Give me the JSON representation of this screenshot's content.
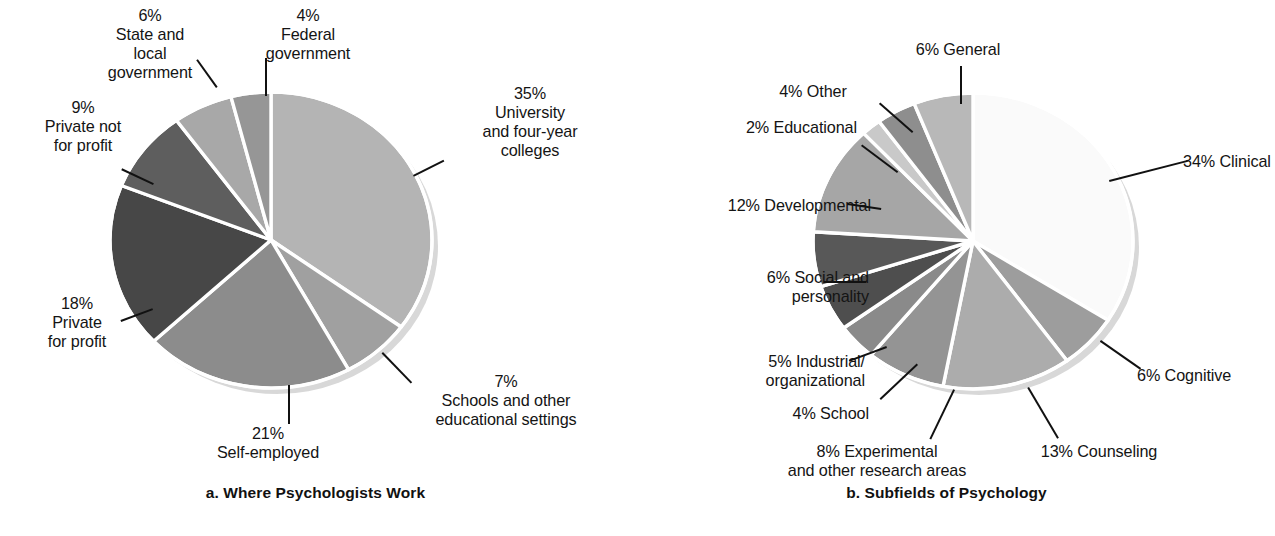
{
  "chart_data": [
    {
      "type": "pie",
      "id": "a",
      "title": "a. Where Psychologists Work",
      "caption": "a. Where Psychologists Work",
      "legend_position": "callout-labels",
      "start_angle_deg": 0,
      "total": 100,
      "unit": "%",
      "slices": [
        {
          "label": "University and four-year colleges",
          "label_lines": "35%\nUniversity\nand four-year\ncolleges",
          "percent_text": "35%",
          "value": 35,
          "color": "#b4b4b4"
        },
        {
          "label": "Schools and other educational settings",
          "label_lines": "7%\nSchools and other\neducational settings",
          "percent_text": "7%",
          "value": 7,
          "color": "#a0a0a0"
        },
        {
          "label": "Self-employed",
          "label_lines": "21%\nSelf-employed",
          "percent_text": "21%",
          "value": 21,
          "color": "#8c8c8c"
        },
        {
          "label": "Private for profit",
          "label_lines": "18%\nPrivate\nfor profit",
          "percent_text": "18%",
          "value": 18,
          "color": "#474747"
        },
        {
          "label": "Private not for profit",
          "label_lines": "9%\nPrivate not\nfor profit",
          "percent_text": "9%",
          "value": 9,
          "color": "#5e5e5e"
        },
        {
          "label": "State and local government",
          "label_lines": "6%\nState and\nlocal\ngovernment",
          "percent_text": "6%",
          "value": 6,
          "color": "#a8a8a8"
        },
        {
          "label": "Federal government",
          "label_lines": "4%\nFederal\ngovernment",
          "percent_text": "4%",
          "value": 4,
          "color": "#969696"
        }
      ]
    },
    {
      "type": "pie",
      "id": "b",
      "title": "b. Subfields of Psychology",
      "caption": "b. Subfields of Psychology",
      "legend_position": "callout-labels",
      "start_angle_deg": 0,
      "total": 100,
      "unit": "%",
      "slices": [
        {
          "label": "Clinical",
          "label_lines": "34% Clinical",
          "percent_text": "34%",
          "value": 34,
          "color": "#fafafa"
        },
        {
          "label": "Cognitive",
          "label_lines": "6% Cognitive",
          "percent_text": "6%",
          "value": 6,
          "color": "#9d9d9d"
        },
        {
          "label": "Counseling",
          "label_lines": "13% Counseling",
          "percent_text": "13%",
          "value": 13,
          "color": "#acacac"
        },
        {
          "label": "Experimental and other research areas",
          "label_lines": "8% Experimental\nand other research areas",
          "percent_text": "8%",
          "value": 8,
          "color": "#949494"
        },
        {
          "label": "School",
          "label_lines": "4% School",
          "percent_text": "4%",
          "value": 4,
          "color": "#8a8a8a"
        },
        {
          "label": "Industrial/organizational",
          "label_lines": "5% Industrial/\norganizational",
          "percent_text": "5%",
          "value": 5,
          "color": "#4e4e4e"
        },
        {
          "label": "Social and personality",
          "label_lines": "6% Social and\npersonality",
          "percent_text": "6%",
          "value": 6,
          "color": "#585858"
        },
        {
          "label": "Developmental",
          "label_lines": "12% Developmental",
          "percent_text": "12%",
          "value": 12,
          "color": "#a6a6a6"
        },
        {
          "label": "Educational",
          "label_lines": "2% Educational",
          "percent_text": "2%",
          "value": 2,
          "color": "#c9c9c9"
        },
        {
          "label": "Other",
          "label_lines": "4% Other",
          "percent_text": "4%",
          "value": 4,
          "color": "#8e8e8e"
        },
        {
          "label": "General",
          "label_lines": "6% General",
          "percent_text": "6%",
          "value": 6,
          "color": "#b8b8b8"
        }
      ]
    }
  ],
  "figure_a": {
    "caption": "a. Where Psychologists Work",
    "geometry": {
      "cx": 271,
      "cy": 240,
      "rx": 161,
      "ry": 148
    },
    "labels": [
      {
        "name": "label-state-and-local-government",
        "text": "6%\nState and\nlocal\ngovernment",
        "x": 60,
        "y": 6,
        "w": 180,
        "align": "ctr",
        "leader": {
          "x1": 216,
          "y1": 88,
          "x2": 196,
          "y2": 60
        }
      },
      {
        "name": "label-federal-government",
        "text": "4%\nFederal\ngovernment",
        "x": 228,
        "y": 6,
        "w": 160,
        "align": "ctr",
        "leader": {
          "x1": 265,
          "y1": 96,
          "x2": 265,
          "y2": 58
        }
      },
      {
        "name": "label-private-not-for-profit",
        "text": "9%\nPrivate not\nfor profit",
        "x": 8,
        "y": 98,
        "w": 150,
        "align": "ctr",
        "leader": {
          "x1": 153,
          "y1": 185,
          "x2": 121,
          "y2": 170
        }
      },
      {
        "name": "label-university-and-four-year-colleges",
        "text": "35%\nUniversity\nand four-year\ncolleges",
        "x": 430,
        "y": 84,
        "w": 200,
        "align": "ctr",
        "leader": {
          "x1": 413,
          "y1": 175,
          "x2": 443,
          "y2": 160
        }
      },
      {
        "name": "label-private-for-profit",
        "text": "18%\nPrivate\nfor profit",
        "x": 12,
        "y": 294,
        "w": 130,
        "align": "ctr",
        "leader": {
          "x1": 153,
          "y1": 310,
          "x2": 121,
          "y2": 322
        }
      },
      {
        "name": "label-schools-and-other-educational-settings",
        "text": "7%\nSchools and other\neducational settings",
        "x": 386,
        "y": 372,
        "w": 240,
        "align": "ctr",
        "leader": {
          "x1": 383,
          "y1": 352,
          "x2": 412,
          "y2": 382
        }
      },
      {
        "name": "label-self-employed",
        "text": "21%\nSelf-employed",
        "x": 178,
        "y": 424,
        "w": 180,
        "align": "ctr",
        "leader": {
          "x1": 290,
          "y1": 385,
          "x2": 290,
          "y2": 424
        }
      }
    ]
  },
  "figure_b": {
    "caption": "b. Subfields of Psychology",
    "geometry": {
      "cx": 342,
      "cy": 241,
      "rx": 160,
      "ry": 148
    },
    "labels": [
      {
        "name": "label-general",
        "text": "6% General",
        "x": 252,
        "y": 40,
        "w": 150,
        "align": "ctr",
        "leader": {
          "x1": 329,
          "y1": 104,
          "x2": 329,
          "y2": 66
        }
      },
      {
        "name": "label-other",
        "text": "4% Other",
        "x": 118,
        "y": 82,
        "w": 128,
        "align": "ctr",
        "leader": {
          "x1": 281,
          "y1": 133,
          "x2": 248,
          "y2": 104
        }
      },
      {
        "name": "label-educational",
        "text": "2% Educational",
        "x": 58,
        "y": 118,
        "w": 168,
        "align": "rt",
        "leader": {
          "x1": 266,
          "y1": 173,
          "x2": 230,
          "y2": 146
        }
      },
      {
        "name": "label-developmental",
        "text": "12% Developmental",
        "x": 40,
        "y": 196,
        "w": 200,
        "align": "rt",
        "leader": {
          "x1": 250,
          "y1": 210,
          "x2": 216,
          "y2": 205
        }
      },
      {
        "name": "label-social-and-personality",
        "text": "6% Social and\npersonality",
        "x": 58,
        "y": 268,
        "w": 180,
        "align": "rt",
        "leader": {
          "x1": 235,
          "y1": 283,
          "x2": 193,
          "y2": 283
        }
      },
      {
        "name": "label-industrial-organizational",
        "text": "5% Industrial/\norganizational",
        "x": 50,
        "y": 352,
        "w": 184,
        "align": "rt",
        "leader": {
          "x1": 256,
          "y1": 348,
          "x2": 218,
          "y2": 362
        }
      },
      {
        "name": "label-school",
        "text": "4% School",
        "x": 88,
        "y": 404,
        "w": 150,
        "align": "rt",
        "leader": {
          "x1": 287,
          "y1": 365,
          "x2": 250,
          "y2": 400
        }
      },
      {
        "name": "label-experimental-and-other-research-areas",
        "text": "8% Experimental\nand other research areas",
        "x": 116,
        "y": 442,
        "w": 260,
        "align": "ctr",
        "leader": {
          "x1": 324,
          "y1": 390,
          "x2": 300,
          "y2": 440
        }
      },
      {
        "name": "label-counseling",
        "text": "13% Counseling",
        "x": 378,
        "y": 442,
        "w": 180,
        "align": "ctr",
        "leader": {
          "x1": 398,
          "y1": 387,
          "x2": 428,
          "y2": 438
        }
      },
      {
        "name": "label-cognitive",
        "text": "6% Cognitive",
        "x": 506,
        "y": 366,
        "w": 146,
        "align": "lf",
        "leader": {
          "x1": 470,
          "y1": 340,
          "x2": 510,
          "y2": 368
        }
      },
      {
        "name": "label-clinical",
        "text": "34% Clinical",
        "x": 552,
        "y": 152,
        "w": 150,
        "align": "lf",
        "leader": {
          "x1": 478,
          "y1": 180,
          "x2": 556,
          "y2": 160
        }
      }
    ]
  }
}
